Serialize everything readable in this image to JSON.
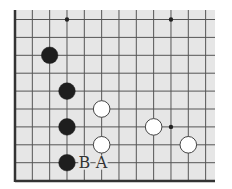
{
  "board": {
    "title": "Go board corner position",
    "background": "#e6e6e6",
    "line_color": "#555555",
    "edge_color": "#333333",
    "area": {
      "x0": 15,
      "y0": 10,
      "x1": 215,
      "y1": 181
    },
    "origin": {
      "x": 15,
      "y": 19.5
    },
    "spacing": {
      "x": 17.33,
      "y": 17.9
    },
    "cols": 12,
    "rows": 10,
    "edges": [
      "left",
      "bottom"
    ]
  },
  "star_points": [
    {
      "col": 3,
      "row": 0
    },
    {
      "col": 9,
      "row": 0
    },
    {
      "col": 9,
      "row": 6
    }
  ],
  "stones": [
    {
      "color": "black",
      "col": 2,
      "row": 2
    },
    {
      "color": "black",
      "col": 3,
      "row": 4
    },
    {
      "color": "black",
      "col": 3,
      "row": 6
    },
    {
      "color": "black",
      "col": 3,
      "row": 8
    },
    {
      "color": "white",
      "col": 5,
      "row": 5
    },
    {
      "color": "white",
      "col": 5,
      "row": 7
    },
    {
      "color": "white",
      "col": 8,
      "row": 6
    },
    {
      "color": "white",
      "col": 10,
      "row": 7
    }
  ],
  "labels": [
    {
      "text": "B",
      "col": 4,
      "row": 8
    },
    {
      "text": "A",
      "col": 5,
      "row": 8
    }
  ]
}
